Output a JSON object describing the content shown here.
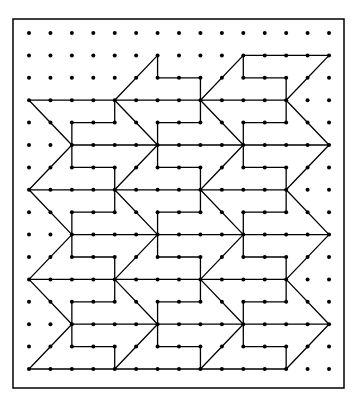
{
  "diagram": {
    "title": "",
    "type": "geoboard-tessellation",
    "colors": {
      "background": "#ffffff",
      "ink": "#000000"
    },
    "frame": {
      "x": 13,
      "y": 19,
      "width": 331,
      "height": 369
    },
    "grid": {
      "cols": 15,
      "rows": 16,
      "origin_x": 29,
      "origin_y": 33,
      "step_x": 21.43,
      "step_y": 22.4,
      "dot_radius": 2
    },
    "segments": [
      [
        0,
        3,
        12,
        3
      ],
      [
        2,
        5,
        14,
        5
      ],
      [
        0,
        7,
        12,
        7
      ],
      [
        2,
        9,
        14,
        9
      ],
      [
        0,
        11,
        12,
        11
      ],
      [
        2,
        13,
        14,
        13
      ],
      [
        0,
        15,
        12,
        15
      ],
      [
        4,
        3,
        6,
        1
      ],
      [
        6,
        1,
        6,
        2
      ],
      [
        6,
        2,
        8,
        2
      ],
      [
        8,
        2,
        8,
        3
      ],
      [
        8,
        3,
        10,
        1
      ],
      [
        10,
        1,
        14,
        1
      ],
      [
        14,
        1,
        12,
        3
      ],
      [
        10,
        1,
        10,
        2
      ],
      [
        10,
        2,
        12,
        2
      ],
      [
        12,
        2,
        12,
        3
      ],
      [
        0,
        3,
        2,
        5
      ],
      [
        2,
        5,
        0,
        7
      ],
      [
        4,
        3,
        6,
        5
      ],
      [
        6,
        5,
        4,
        7
      ],
      [
        8,
        3,
        10,
        5
      ],
      [
        10,
        5,
        8,
        7
      ],
      [
        12,
        3,
        14,
        5
      ],
      [
        14,
        5,
        12,
        7
      ],
      [
        0,
        7,
        2,
        9
      ],
      [
        2,
        9,
        0,
        11
      ],
      [
        4,
        7,
        6,
        9
      ],
      [
        6,
        9,
        4,
        11
      ],
      [
        8,
        7,
        10,
        9
      ],
      [
        10,
        9,
        8,
        11
      ],
      [
        12,
        7,
        14,
        9
      ],
      [
        14,
        9,
        12,
        11
      ],
      [
        0,
        11,
        2,
        13
      ],
      [
        2,
        13,
        0,
        15
      ],
      [
        4,
        11,
        6,
        13
      ],
      [
        6,
        13,
        4,
        15
      ],
      [
        8,
        11,
        10,
        13
      ],
      [
        10,
        13,
        8,
        15
      ],
      [
        12,
        11,
        14,
        13
      ],
      [
        14,
        13,
        12,
        15
      ],
      [
        4,
        3,
        4,
        4
      ],
      [
        2,
        4,
        4,
        4
      ],
      [
        2,
        4,
        2,
        6
      ],
      [
        2,
        6,
        4,
        6
      ],
      [
        4,
        6,
        4,
        7
      ],
      [
        8,
        3,
        8,
        4
      ],
      [
        6,
        4,
        8,
        4
      ],
      [
        6,
        4,
        6,
        6
      ],
      [
        6,
        6,
        8,
        6
      ],
      [
        8,
        6,
        8,
        7
      ],
      [
        12,
        3,
        12,
        4
      ],
      [
        10,
        4,
        12,
        4
      ],
      [
        10,
        4,
        10,
        6
      ],
      [
        10,
        6,
        12,
        6
      ],
      [
        12,
        6,
        12,
        7
      ],
      [
        4,
        7,
        4,
        8
      ],
      [
        2,
        8,
        4,
        8
      ],
      [
        2,
        8,
        2,
        10
      ],
      [
        2,
        10,
        4,
        10
      ],
      [
        4,
        10,
        4,
        11
      ],
      [
        8,
        7,
        8,
        8
      ],
      [
        6,
        8,
        8,
        8
      ],
      [
        6,
        8,
        6,
        10
      ],
      [
        6,
        10,
        8,
        10
      ],
      [
        8,
        10,
        8,
        11
      ],
      [
        12,
        7,
        12,
        8
      ],
      [
        10,
        8,
        12,
        8
      ],
      [
        10,
        8,
        10,
        10
      ],
      [
        10,
        10,
        12,
        10
      ],
      [
        12,
        10,
        12,
        11
      ],
      [
        4,
        11,
        4,
        12
      ],
      [
        2,
        12,
        4,
        12
      ],
      [
        2,
        12,
        2,
        14
      ],
      [
        2,
        14,
        4,
        14
      ],
      [
        4,
        14,
        4,
        15
      ],
      [
        8,
        11,
        8,
        12
      ],
      [
        6,
        12,
        8,
        12
      ],
      [
        6,
        12,
        6,
        14
      ],
      [
        6,
        14,
        8,
        14
      ],
      [
        8,
        14,
        8,
        15
      ],
      [
        12,
        11,
        12,
        12
      ],
      [
        10,
        12,
        12,
        12
      ],
      [
        10,
        12,
        10,
        14
      ],
      [
        10,
        14,
        12,
        14
      ],
      [
        12,
        14,
        12,
        15
      ]
    ]
  }
}
